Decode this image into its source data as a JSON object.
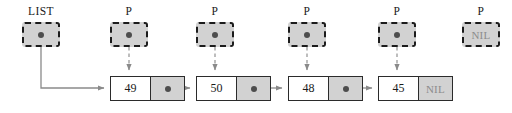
{
  "diagram": {
    "colors": {
      "background": "#ffffff",
      "box_fill": "#d2d2d2",
      "box_border": "#1c1c1c",
      "node_border": "#2b2b2b",
      "node_fill": "#ffffff",
      "pointer_cell_fill": "#d2d2d2",
      "dot": "#4d4d4d",
      "nil_text": "#8c8c8c",
      "arrow": "#8a8a8a",
      "text": "#1a1a1a"
    },
    "variables": [
      {
        "label": "LIST",
        "content": "dot",
        "value": "",
        "x": 22,
        "y": 22,
        "label_x": 22,
        "label_y": 5
      },
      {
        "label": "P",
        "content": "dot",
        "value": "",
        "x": 110,
        "y": 22,
        "label_x": 110,
        "label_y": 5
      },
      {
        "label": "P",
        "content": "dot",
        "value": "",
        "x": 196,
        "y": 22,
        "label_x": 196,
        "label_y": 5
      },
      {
        "label": "P",
        "content": "dot",
        "value": "",
        "x": 288,
        "y": 22,
        "label_x": 288,
        "label_y": 5
      },
      {
        "label": "P",
        "content": "dot",
        "value": "",
        "x": 378,
        "y": 22,
        "label_x": 378,
        "label_y": 5
      },
      {
        "label": "P",
        "content": "nil",
        "value": "NIL",
        "x": 462,
        "y": 22,
        "label_x": 462,
        "label_y": 5
      }
    ],
    "nodes": [
      {
        "data": "49",
        "next": "dot",
        "next_value": "",
        "x": 110,
        "y": 76
      },
      {
        "data": "50",
        "next": "dot",
        "next_value": "",
        "x": 196,
        "y": 76
      },
      {
        "data": "48",
        "next": "dot",
        "next_value": "",
        "x": 288,
        "y": 76
      },
      {
        "data": "45",
        "next": "nil",
        "next_value": "NIL",
        "x": 378,
        "y": 76
      }
    ]
  }
}
